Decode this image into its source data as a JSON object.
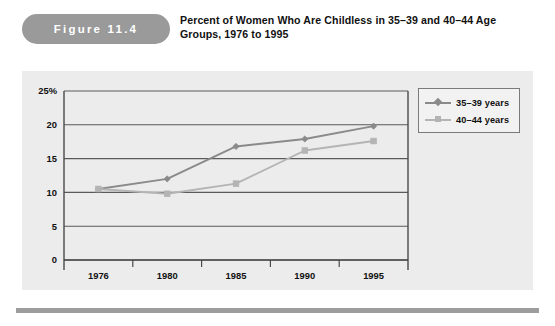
{
  "figure": {
    "label": "Figure 11.4",
    "title": "Percent of Women Who Are Childless in 35–39 and 40–44 Age Groups, 1976 to 1995"
  },
  "colors": {
    "panel_background": "#ececec",
    "page_background": "#ffffff",
    "pill_background": "#9a9a9a",
    "pill_text": "#ffffff",
    "series_35_39": "#8a8a8a",
    "series_40_44": "#b4b4b4",
    "axis": "#4a4a4a",
    "gridline": "#5a5a5a",
    "legend_background": "#f2f2f2",
    "legend_border": "#7a7a7a",
    "bottom_rule": "#9d9d9d"
  },
  "chart_data": {
    "type": "line",
    "title": "Percent of Women Who Are Childless in 35–39 and 40–44 Age Groups, 1976 to 1995",
    "xlabel": "",
    "ylabel": "",
    "categories": [
      "1976",
      "1980",
      "1985",
      "1990",
      "1995"
    ],
    "series": [
      {
        "name": "35–39 years",
        "marker": "diamond",
        "color": "#8a8a8a",
        "values": [
          10.5,
          12.0,
          16.8,
          17.9,
          19.8
        ]
      },
      {
        "name": "40–44 years",
        "marker": "square",
        "color": "#b4b4b4",
        "values": [
          10.5,
          9.8,
          11.3,
          16.2,
          17.6
        ]
      }
    ],
    "ylim": [
      0,
      25
    ],
    "yticks": [
      0,
      5,
      10,
      15,
      20,
      25
    ],
    "ytick_labels": [
      "0",
      "5",
      "10",
      "15",
      "20",
      "25%"
    ],
    "grid": true,
    "legend_position": "top-right"
  },
  "legend": {
    "entries": [
      {
        "label": "35–39 years",
        "marker": "diamond",
        "color": "#8a8a8a"
      },
      {
        "label": "40–44 years",
        "marker": "square",
        "color": "#b4b4b4"
      }
    ]
  }
}
